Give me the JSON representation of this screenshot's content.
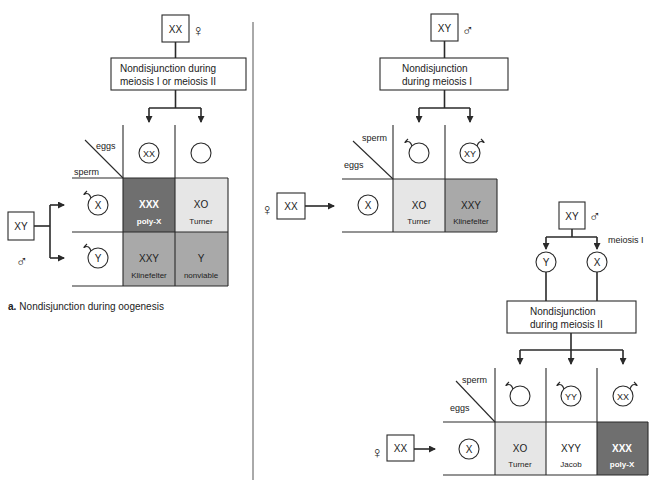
{
  "colors": {
    "dark": "#6f6f6f",
    "medium": "#a9a9a9",
    "light": "#e6e6e6",
    "white": "#ffffff",
    "line": "#2a2a2a"
  },
  "panel_a": {
    "parent_female": {
      "karyotype": "XX",
      "sex_symbol": "♀"
    },
    "process_box": {
      "line1": "Nondisjunction during",
      "line2": "meiosis I or meiosis II"
    },
    "parent_male": {
      "karyotype": "XY",
      "sex_symbol": "♂"
    },
    "grid": {
      "col_label": "eggs",
      "row_label": "sperm",
      "eggs": [
        "XX",
        ""
      ],
      "sperm": [
        "X",
        "Y"
      ],
      "cells": [
        [
          {
            "karyotype": "XXX",
            "name": "poly-X",
            "shade": "dark"
          },
          {
            "karyotype": "XO",
            "name": "Turner",
            "shade": "light"
          }
        ],
        [
          {
            "karyotype": "XXY",
            "name": "Klinefelter",
            "shade": "medium"
          },
          {
            "karyotype": "Y",
            "name": "nonviable",
            "shade": "medium"
          }
        ]
      ]
    },
    "caption_prefix": "a.",
    "caption": "Nondisjunction during oogenesis"
  },
  "panel_b_meiosis1": {
    "parent_male": {
      "karyotype": "XY",
      "sex_symbol": "♂"
    },
    "process_box": {
      "line1": "Nondisjunction",
      "line2": "during meiosis I"
    },
    "parent_female": {
      "karyotype": "XX",
      "sex_symbol": "♀"
    },
    "grid": {
      "col_label": "sperm",
      "row_label": "eggs",
      "sperm": [
        "",
        "XY"
      ],
      "eggs": [
        "X"
      ],
      "cells": [
        [
          {
            "karyotype": "XO",
            "name": "Turner",
            "shade": "light"
          },
          {
            "karyotype": "XXY",
            "name": "Klinefelter",
            "shade": "medium"
          }
        ]
      ]
    }
  },
  "panel_b_meiosis2": {
    "parent_male": {
      "karyotype": "XY",
      "sex_symbol": "♂"
    },
    "meiosis_label": "meiosis I",
    "products": [
      "Y",
      "X"
    ],
    "process_box": {
      "line1": "Nondisjunction",
      "line2": "during meiosis II"
    },
    "parent_female": {
      "karyotype": "XX",
      "sex_symbol": "♀"
    },
    "grid": {
      "col_label": "sperm",
      "row_label": "eggs",
      "sperm": [
        "",
        "YY",
        "XX"
      ],
      "eggs": [
        "X"
      ],
      "cells": [
        [
          {
            "karyotype": "XO",
            "name": "Turner",
            "shade": "light"
          },
          {
            "karyotype": "XYY",
            "name": "Jacob",
            "shade": "white"
          },
          {
            "karyotype": "XXX",
            "name": "poly-X",
            "shade": "dark"
          }
        ]
      ]
    }
  }
}
